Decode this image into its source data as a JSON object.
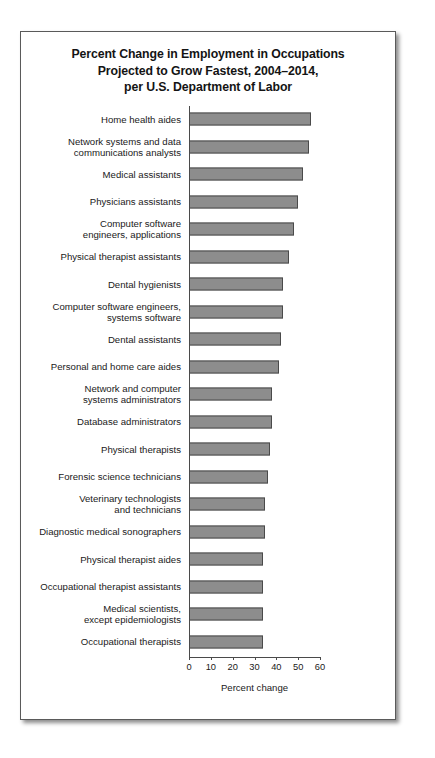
{
  "figure": {
    "title_lines": [
      "Percent Change in Employment in Occupations",
      "Projected to Grow Fastest, 2004–2014,",
      "per U.S. Department of Labor"
    ],
    "bar_fill_color": "#8d8d8d",
    "bar_border_color": "#4a4a4a",
    "axis_color": "#4a4a4a",
    "background_color": "#ffffff"
  },
  "chart_data": {
    "type": "bar",
    "orientation": "horizontal",
    "title": "Percent Change in Employment in Occupations Projected to Grow Fastest, 2004–2014, per U.S. Department of Labor",
    "xlabel": "Percent change",
    "ylabel": "",
    "xlim": [
      0,
      60
    ],
    "xticks": [
      0,
      10,
      20,
      30,
      40,
      50,
      60
    ],
    "xtick_labels": [
      "0",
      "10",
      "20",
      "30",
      "40",
      "50",
      "60"
    ],
    "grid": false,
    "legend": false,
    "categories": [
      "Home health aides",
      "Network systems and data communications analysts",
      "Medical assistants",
      "Physicians assistants",
      "Computer software engineers, applications",
      "Physical therapist assistants",
      "Dental hygienists",
      "Computer software engineers, systems software",
      "Dental assistants",
      "Personal and home care aides",
      "Network and computer systems administrators",
      "Database administrators",
      "Physical therapists",
      "Forensic science technicians",
      "Veterinary technologists and technicians",
      "Diagnostic medical sonographers",
      "Physical therapist aides",
      "Occupational therapist assistants",
      "Medical scientists, except epidemiologists",
      "Occupational therapists"
    ],
    "category_label_lines": [
      [
        "Home health aides"
      ],
      [
        "Network systems and data",
        "communications analysts"
      ],
      [
        "Medical assistants"
      ],
      [
        "Physicians assistants"
      ],
      [
        "Computer software",
        "engineers, applications"
      ],
      [
        "Physical therapist assistants"
      ],
      [
        "Dental hygienists"
      ],
      [
        "Computer software engineers,",
        "systems software"
      ],
      [
        "Dental assistants"
      ],
      [
        "Personal and home care aides"
      ],
      [
        "Network and computer",
        "systems administrators"
      ],
      [
        "Database administrators"
      ],
      [
        "Physical therapists"
      ],
      [
        "Forensic science technicians"
      ],
      [
        "Veterinary technologists",
        "and technicians"
      ],
      [
        "Diagnostic medical sonographers"
      ],
      [
        "Physical therapist aides"
      ],
      [
        "Occupational therapist assistants"
      ],
      [
        "Medical scientists,",
        "except epidemiologists"
      ],
      [
        "Occupational therapists"
      ]
    ],
    "values": [
      56,
      55,
      52,
      50,
      48,
      46,
      43,
      43,
      42,
      41,
      38,
      38,
      37,
      36,
      35,
      35,
      34,
      34,
      34,
      34
    ]
  }
}
